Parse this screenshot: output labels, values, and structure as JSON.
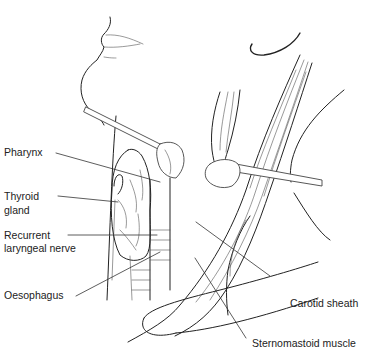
{
  "figure": {
    "labels": [
      {
        "id": "pharynx",
        "text": "Pharynx"
      },
      {
        "id": "thyroid",
        "text_line1": "Thyroid",
        "text_line2": "gland"
      },
      {
        "id": "recurrent",
        "text_line1": "Recurrent",
        "text_line2": "laryngeal nerve"
      },
      {
        "id": "oesophagus",
        "text": "Oesophagus"
      },
      {
        "id": "carotid",
        "text": "Carotid sheath"
      },
      {
        "id": "sternomastoid",
        "text": "Sternomastoid muscle"
      }
    ]
  }
}
